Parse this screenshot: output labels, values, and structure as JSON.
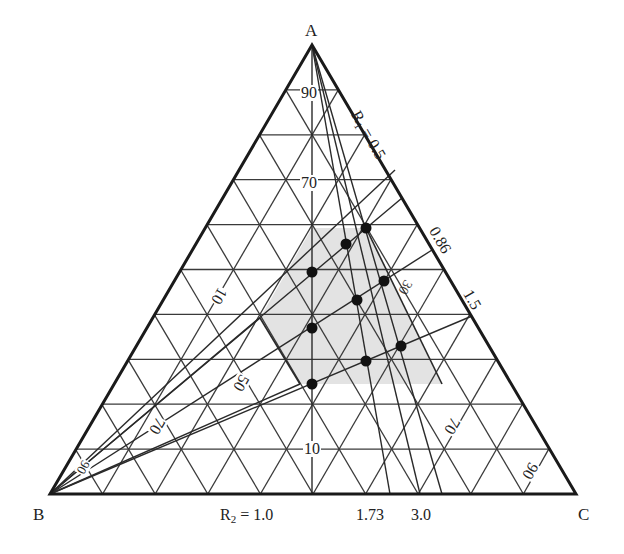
{
  "diagram": {
    "type": "ternary-diagram",
    "vertices": {
      "top": "A",
      "bottom_left": "B",
      "bottom_right": "C"
    },
    "grid_labels": {
      "A_axis": [
        "90",
        "70",
        "10"
      ],
      "B_axis": [
        "10",
        "50",
        "70",
        "90"
      ],
      "C_axis": [
        "70",
        "90"
      ],
      "partial_hidden": "30"
    },
    "R1_rays": {
      "title": "R",
      "subscript": "1",
      "first_value": "= 0.5",
      "values": [
        "0.86",
        "1.5"
      ]
    },
    "R2_rays": {
      "title": "R",
      "subscript": "2",
      "first_value": "= 1.0",
      "values": [
        "1.73",
        "3.0"
      ]
    },
    "shaded_region": {
      "fill": "#e3e3e3",
      "polygon": [
        [
          312,
          228
        ],
        [
          366,
          228
        ],
        [
          442,
          384
        ],
        [
          300,
          384
        ],
        [
          260,
          318
        ]
      ]
    },
    "points": [
      [
        366,
        228
      ],
      [
        346,
        244
      ],
      [
        312,
        272
      ],
      [
        384,
        281
      ],
      [
        357,
        300
      ],
      [
        312,
        328
      ],
      [
        401,
        346
      ],
      [
        366,
        361
      ],
      [
        312,
        384
      ]
    ],
    "colors": {
      "line": "#2a2a2a",
      "edge": "#1a1a1a",
      "point": "#111111"
    }
  }
}
